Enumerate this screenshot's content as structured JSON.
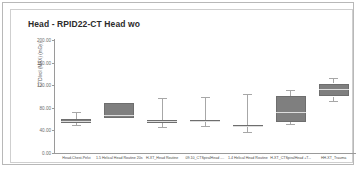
{
  "chart_title": "Head - RPID22-CT Head wo",
  "chart_data": {
    "type": "box",
    "title": "Head - RPID22-CT Head wo",
    "xlabel": "",
    "ylabel": "CTDIvol (MAX) (mGy)",
    "ylim": [
      0,
      200
    ],
    "yticks": [
      0,
      40,
      80,
      120,
      160,
      200
    ],
    "ytick_labels": [
      "0.00",
      "40.00",
      "80.00",
      "120.00",
      "160.00",
      "200.00"
    ],
    "grid": false,
    "legend": "none",
    "categories": [
      "Head-Chest-Pelvi",
      "1.5 Helical Head Routine 20s",
      "H-XT_Head Routine",
      "09.10_CTSpiralHead -...",
      "1.4 Helical Head Routine",
      "H-XT_CTSpiralHead +T...",
      "HH-XT_Trauma"
    ],
    "boxes": [
      {
        "name": "Head-Chest-Pelvi",
        "whisker_low": 50.0,
        "q1": 53.0,
        "median": 56.0,
        "q3": 60.0,
        "whisker_high": 72.0
      },
      {
        "name": "1.5 Helical Head Routine 20s",
        "whisker_low": 62.0,
        "q1": 62.0,
        "median": 68.0,
        "q3": 88.0,
        "whisker_high": 88.0
      },
      {
        "name": "H-XT_Head Routine",
        "whisker_low": 46.0,
        "q1": 54.0,
        "median": 56.0,
        "q3": 58.0,
        "whisker_high": 98.0
      },
      {
        "name": "09.10_CTSpiralHead -...",
        "whisker_low": 47.0,
        "q1": 55.0,
        "median": 57.0,
        "q3": 59.0,
        "whisker_high": 99.0
      },
      {
        "name": "1.4 Helical Head Routine",
        "whisker_low": 37.0,
        "q1": 46.0,
        "median": 48.0,
        "q3": 50.0,
        "whisker_high": 104.0
      },
      {
        "name": "H-XT_CTSpiralHead +T...",
        "whisker_low": 51.0,
        "q1": 54.0,
        "median": 72.0,
        "q3": 101.0,
        "whisker_high": 112.0
      },
      {
        "name": "HH-XT_Trauma",
        "whisker_low": 92.0,
        "q1": 100.0,
        "median": 113.0,
        "median2": 113.0,
        "q3": 123.0,
        "whisker_high": 132.0
      }
    ],
    "colors": {
      "box_fill": "#7f7f7f",
      "box_border": "#6e6e6e",
      "median": "#dedede",
      "whisker": "#a7a7a7",
      "axis": "#9a9a9a",
      "background": "#ffffff",
      "title_text": "#2b2b2b"
    }
  }
}
